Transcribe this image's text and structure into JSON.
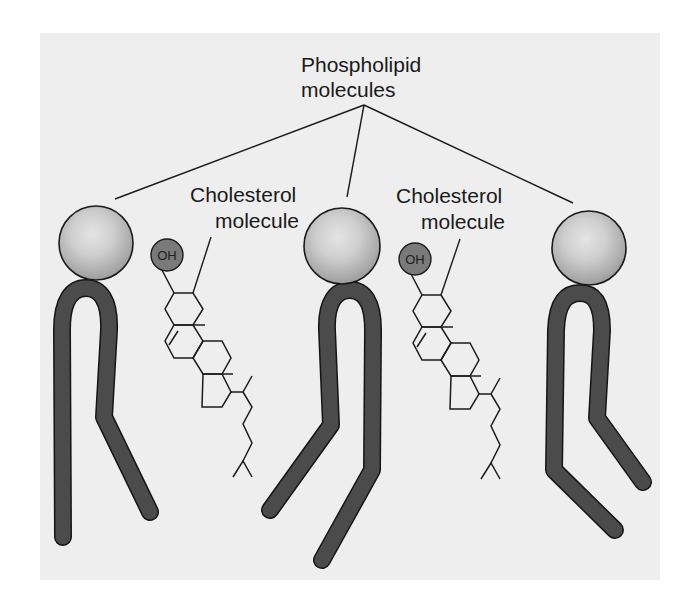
{
  "figure": {
    "type": "membrane-diagram",
    "colors": {
      "page_background": "#ffffff",
      "panel_background": "#eeeeee",
      "head_highlight": "#e2e2e2",
      "head_edge": "#a2a2a2",
      "tail_fill": "#4b4b4b",
      "oh_fill": "#7a7a7a",
      "line": "#1a1a1a"
    }
  },
  "labels": {
    "phospholipid_line1": "Phospholipid",
    "phospholipid_line2": "molecules",
    "cholesterol_left_line1": "Cholesterol",
    "cholesterol_left_line2": "molecule",
    "cholesterol_right_line1": "Cholesterol",
    "cholesterol_right_line2": "molecule",
    "oh_left": "OH",
    "oh_right": "OH"
  },
  "phospholipids": [
    {
      "name": "phospholipid-left",
      "head": "polar head",
      "tails": 2
    },
    {
      "name": "phospholipid-middle",
      "head": "polar head",
      "tails": 2
    },
    {
      "name": "phospholipid-right",
      "head": "polar head",
      "tails": 2
    }
  ],
  "cholesterols": [
    {
      "name": "cholesterol-left",
      "hydroxyl": "OH",
      "rings": 4
    },
    {
      "name": "cholesterol-right",
      "hydroxyl": "OH",
      "rings": 4
    }
  ]
}
